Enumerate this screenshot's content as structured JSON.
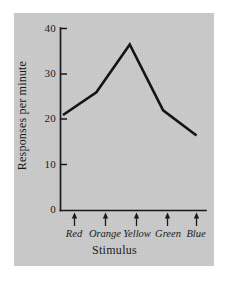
{
  "figure": {
    "panel_background": "#cccccc",
    "page_background": "#ffffff",
    "ink_color": "#141414"
  },
  "chart_data": {
    "type": "line",
    "title": "",
    "subtitle": "",
    "xlabel": "Stimulus",
    "ylabel": "Responses per minute",
    "categories": [
      "Red",
      "Orange",
      "Yellow",
      "Green",
      "Blue"
    ],
    "values": [
      21,
      26,
      36.5,
      22,
      16.5
    ],
    "series": [
      {
        "name": "Responses per minute",
        "values": [
          21,
          26,
          36.5,
          22,
          16.5
        ]
      }
    ],
    "ylim": [
      0,
      40
    ],
    "ytick_labels": [
      "0",
      "10",
      "20",
      "30",
      "40"
    ],
    "ytick_values": [
      0,
      10,
      20,
      30,
      40
    ],
    "grid": false,
    "legend": false,
    "legend_position": "none",
    "xtick_style": "arrow-markers",
    "annotations": []
  },
  "axes": {
    "y_title": "Responses per minute",
    "x_title": "Stimulus",
    "y_ticks": [
      {
        "label": "40",
        "value": 40
      },
      {
        "label": "30",
        "value": 30
      },
      {
        "label": "20",
        "value": 20
      },
      {
        "label": "10",
        "value": 10
      },
      {
        "label": "0",
        "value": 0
      }
    ],
    "x_categories": [
      {
        "label": "Red"
      },
      {
        "label": "Orange"
      },
      {
        "label": "Yellow"
      },
      {
        "label": "Green"
      },
      {
        "label": "Blue"
      }
    ]
  }
}
